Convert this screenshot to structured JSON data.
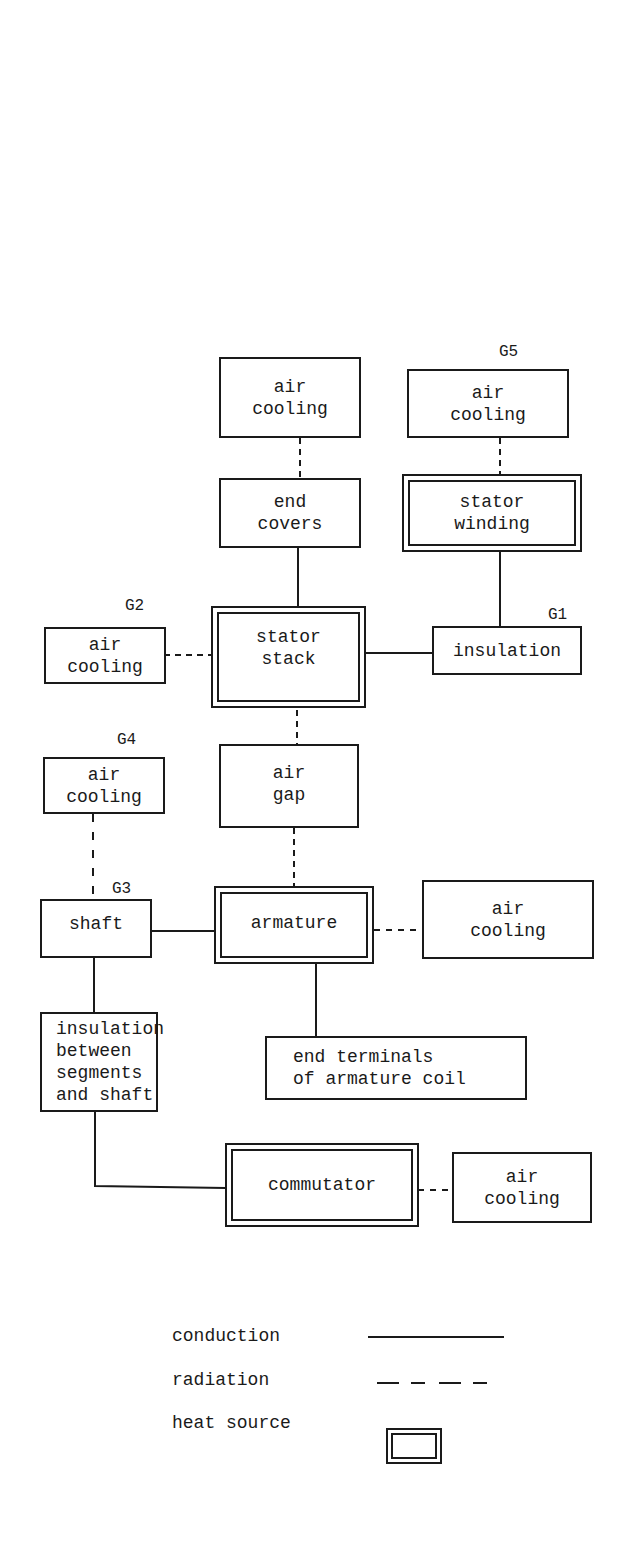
{
  "diagram": {
    "nodes": {
      "air_cooling_top": "air\ncooling",
      "air_cooling_g5": "air\ncooling",
      "end_covers": "end\ncovers",
      "stator_winding": "stator\nwinding",
      "air_cooling_g2": "air\ncooling",
      "stator_stack": "stator\nstack",
      "insulation": "insulation",
      "air_cooling_g4": "air\ncooling",
      "air_gap": "air\ngap",
      "shaft": "shaft",
      "armature": "armature",
      "air_cooling_armature": "air\ncooling",
      "insulation_segments": "insulation\nbetween\nsegments\nand shaft",
      "end_terminals": "end terminals\nof armature coil",
      "commutator": "commutator",
      "air_cooling_commutator": "air\ncooling"
    },
    "group_labels": {
      "g1": "G1",
      "g2": "G2",
      "g3": "G3",
      "g4": "G4",
      "g5": "G5"
    },
    "heat_sources": [
      "stator winding",
      "stator stack",
      "armature",
      "commutator"
    ],
    "connections": [
      {
        "from": "air cooling (top)",
        "to": "end covers",
        "type": "radiation"
      },
      {
        "from": "air cooling (G5)",
        "to": "stator winding",
        "type": "radiation"
      },
      {
        "from": "end covers",
        "to": "stator stack",
        "type": "conduction"
      },
      {
        "from": "stator winding",
        "to": "insulation",
        "type": "conduction"
      },
      {
        "from": "air cooling (G2)",
        "to": "stator stack",
        "type": "radiation"
      },
      {
        "from": "stator stack",
        "to": "insulation",
        "type": "conduction"
      },
      {
        "from": "stator stack",
        "to": "air gap",
        "type": "radiation"
      },
      {
        "from": "air gap",
        "to": "armature",
        "type": "radiation"
      },
      {
        "from": "air cooling (G4)",
        "to": "shaft",
        "type": "radiation"
      },
      {
        "from": "shaft",
        "to": "armature",
        "type": "conduction"
      },
      {
        "from": "armature",
        "to": "air cooling",
        "type": "radiation"
      },
      {
        "from": "armature",
        "to": "end terminals of armature coil",
        "type": "conduction"
      },
      {
        "from": "shaft",
        "to": "insulation between segments and shaft",
        "type": "conduction"
      },
      {
        "from": "insulation between segments and shaft",
        "to": "commutator",
        "type": "conduction"
      },
      {
        "from": "commutator",
        "to": "air cooling",
        "type": "radiation"
      }
    ]
  },
  "legend": {
    "conduction": "conduction",
    "radiation": "radiation",
    "heat_source": "heat source"
  }
}
